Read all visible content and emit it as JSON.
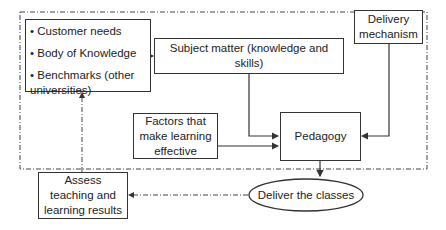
{
  "diagram": {
    "inputs_box": {
      "items": [
        "• Customer needs",
        "• Body of Knowledge",
        "• Benchmarks (other universities)"
      ]
    },
    "subject_matter": "Subject matter (knowledge and skills)",
    "delivery_mechanism": "Delivery mechanism",
    "factors": "Factors that make learning effective",
    "pedagogy": "Pedagogy",
    "deliver": "Deliver the classes",
    "assess": "Assess teaching and learning results",
    "colors": {
      "line": "#333333",
      "background": "#ffffff"
    }
  }
}
